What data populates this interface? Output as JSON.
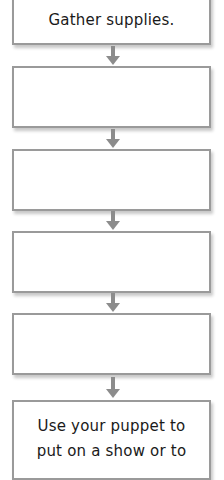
{
  "flowchart": {
    "steps": [
      {
        "label": "Gather supplies."
      },
      {
        "label": ""
      },
      {
        "label": ""
      },
      {
        "label": ""
      },
      {
        "label": ""
      },
      {
        "label": "Use your puppet to put on a show or to"
      }
    ],
    "last_step_lines": [
      "Use your puppet to",
      "put on a show or to"
    ],
    "colors": {
      "border": "#9a9a9a",
      "arrow": "#8c8c8c",
      "text": "#1a1a1a",
      "background": "#ffffff"
    },
    "arrow_icon": "down-arrow-icon"
  }
}
